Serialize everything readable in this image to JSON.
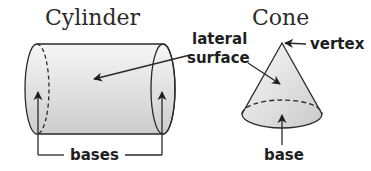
{
  "diagram": {
    "titles": {
      "cylinder": "Cylinder",
      "cone": "Cone"
    },
    "labels": {
      "lateral_line1": "lateral",
      "lateral_line2": "surface",
      "vertex": "vertex",
      "bases": "bases",
      "base": "base"
    },
    "colors": {
      "stroke": "#2a2a2a",
      "fill_light": "#f4f4f4",
      "fill_dark": "#cfcfcf",
      "text": "#1e1e1e"
    }
  }
}
